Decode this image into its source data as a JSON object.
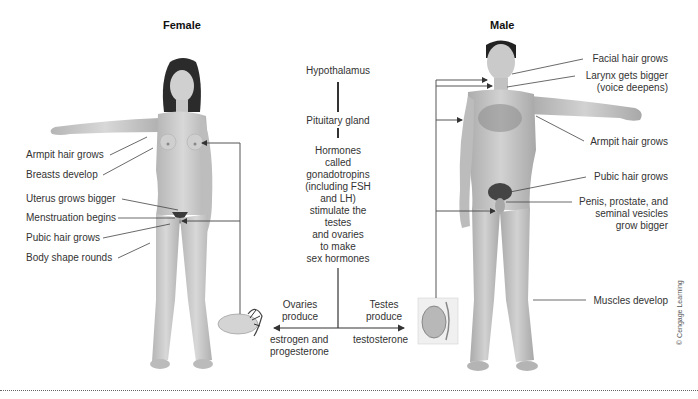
{
  "female": {
    "title": "Female",
    "labels": [
      "Armpit hair grows",
      "Breasts develop",
      "Uterus grows bigger",
      "Menstruation begins",
      "Pubic hair grows",
      "Body shape rounds"
    ]
  },
  "male": {
    "title": "Male",
    "labels": {
      "facial": "Facial hair grows",
      "larynx1": "Larynx gets bigger",
      "larynx2": "(voice deepens)",
      "armpit": "Armpit hair grows",
      "pubic": "Pubic hair grows",
      "penis1": "Penis, prostate, and",
      "penis2": "seminal vesicles",
      "penis3": "grow bigger",
      "muscles": "Muscles develop"
    }
  },
  "center": {
    "hypothalamus": "Hypothalamus",
    "pituitary": "Pituitary gland",
    "hormones": [
      "Hormones",
      "called",
      "gonadotropins",
      "(including FSH",
      "and LH)",
      "stimulate the",
      "testes",
      "and ovaries",
      "to make",
      "sex hormones"
    ],
    "ovaries1": "Ovaries",
    "ovaries2": "produce",
    "testes1": "Testes",
    "testes2": "produce",
    "estrogen1": "estrogen and",
    "estrogen2": "progesterone",
    "testosterone": "testosterone"
  },
  "credit": "© Cengage Learning",
  "colors": {
    "skin": "#c9c9c9",
    "hair": "#2a2a2a",
    "line": "#555555"
  }
}
